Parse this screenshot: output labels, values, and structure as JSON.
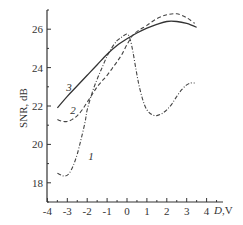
{
  "chart_data": {
    "type": "line",
    "title": "",
    "xlabel": "D,V",
    "xlabel_parts": {
      "var": "D",
      "unit": ",V"
    },
    "ylabel": "SNR, dB",
    "xlim": [
      -4,
      4.8
    ],
    "ylim": [
      17,
      27
    ],
    "xticks": [
      -4,
      -3,
      -2,
      -1,
      0,
      1,
      2,
      3,
      4
    ],
    "xtick_labels": [
      "-4",
      "-3",
      "-2",
      "-1",
      "0",
      "1",
      "2",
      "3",
      "4"
    ],
    "x_minor_step": 0.5,
    "yticks": [
      18,
      20,
      22,
      24,
      26
    ],
    "ytick_labels": [
      "18",
      "20",
      "22",
      "24",
      "26"
    ],
    "y_minor_step": 1,
    "grid": false,
    "legend": "none",
    "series": [
      {
        "name": "1",
        "style": "dash-dot",
        "color": "#444444",
        "label_at": [
          -1.95,
          19.2
        ],
        "x": [
          -3.5,
          -3.3,
          -3.1,
          -2.9,
          -2.7,
          -2.5,
          -2.3,
          -2.1,
          -2.0,
          -1.75,
          -1.5,
          -1.25,
          -1.0,
          -0.75,
          -0.5,
          -0.25,
          0.0,
          0.15,
          0.3,
          0.45,
          0.6,
          0.8,
          1.0,
          1.25,
          1.5,
          1.75,
          2.0,
          2.25,
          2.5,
          2.75,
          3.0,
          3.2,
          3.4
        ],
        "y": [
          18.5,
          18.4,
          18.35,
          18.5,
          18.9,
          19.5,
          20.3,
          21.2,
          21.8,
          22.7,
          23.4,
          24.0,
          24.6,
          25.05,
          25.4,
          25.6,
          25.75,
          25.5,
          24.8,
          23.9,
          23.1,
          22.3,
          21.8,
          21.55,
          21.5,
          21.6,
          21.8,
          22.1,
          22.5,
          22.85,
          23.1,
          23.2,
          23.2
        ]
      },
      {
        "name": "2",
        "style": "dashed",
        "color": "#444444",
        "label_at": [
          -2.85,
          21.6
        ],
        "x": [
          -3.5,
          -3.25,
          -3.0,
          -2.75,
          -2.5,
          -2.25,
          -2.0,
          -1.75,
          -1.5,
          -1.25,
          -1.0,
          -0.75,
          -0.5,
          -0.25,
          0.0,
          0.3,
          0.6,
          1.0,
          1.5,
          2.0,
          2.5,
          3.0,
          3.4
        ],
        "y": [
          21.3,
          21.2,
          21.2,
          21.3,
          21.5,
          21.8,
          22.2,
          22.6,
          23.0,
          23.3,
          23.6,
          23.95,
          24.3,
          24.7,
          25.2,
          25.7,
          25.95,
          26.2,
          26.55,
          26.75,
          26.8,
          26.6,
          26.3
        ]
      },
      {
        "name": "3",
        "style": "solid",
        "color": "#333333",
        "label_at": [
          -3.05,
          22.8
        ],
        "x": [
          -3.5,
          -3.0,
          -2.5,
          -2.0,
          -1.5,
          -1.0,
          -0.5,
          0.0,
          0.5,
          1.0,
          1.5,
          2.0,
          2.5,
          3.0,
          3.5
        ],
        "y": [
          21.9,
          22.5,
          23.05,
          23.6,
          24.15,
          24.7,
          25.15,
          25.5,
          25.8,
          26.05,
          26.25,
          26.4,
          26.4,
          26.3,
          26.1
        ]
      }
    ]
  }
}
